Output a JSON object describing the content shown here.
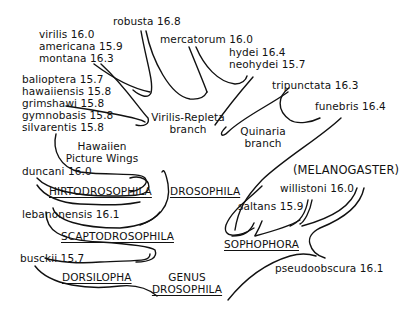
{
  "species": [
    {
      "name": "robusta",
      "value": "16.8"
    },
    {
      "name": "virilis",
      "value": "16.0"
    },
    {
      "name": "americana",
      "value": "15.9"
    },
    {
      "name": "montana",
      "value": "16.3"
    },
    {
      "name": "mercatorum",
      "value": "16.0"
    },
    {
      "name": "hydei",
      "value": "16.4"
    },
    {
      "name": "neohydei",
      "value": "15.7"
    },
    {
      "name": "balioptera",
      "value": "15.7"
    },
    {
      "name": "hawaiiensis",
      "value": "15.8"
    },
    {
      "name": "grimshawi",
      "value": "15.8"
    },
    {
      "name": "gymnobasis",
      "value": "15.8"
    },
    {
      "name": "silvarentis",
      "value": "15.8"
    },
    {
      "name": "tripunctata",
      "value": "16.3"
    },
    {
      "name": "funebris",
      "value": "16.4"
    },
    {
      "name": "duncani",
      "value": "16.0"
    },
    {
      "name": "willistoni",
      "value": "16.0"
    },
    {
      "name": "saltans",
      "value": "15.9"
    },
    {
      "name": "lebanonensis",
      "value": "16.1"
    },
    {
      "name": "busckii",
      "value": "15.7"
    },
    {
      "name": "pseudoobscura",
      "value": "16.1"
    }
  ],
  "labels": {
    "species_lines": {
      "robusta": "robusta 16.8",
      "virilis": "virilis 16.0",
      "americana": "americana 15.9",
      "montana": "montana 16.3",
      "mercatorum": "mercatorum 16.0",
      "hydei": "hydei 16.4",
      "neohydei": "neohydei 15.7",
      "balioptera": "balioptera 15.7",
      "hawaiiensis": "hawaiiensis 15.8",
      "grimshawi": "grimshawi 15.8",
      "gymnobasis": "gymnobasis 15.8",
      "silvarentis": "silvarentis 15.8",
      "tripunctata": "tripunctata 16.3",
      "funebris": "funebris 16.4",
      "duncani": "duncani 16.0",
      "willistoni": "willistoni 16.0",
      "saltans": "saltans 15.9",
      "lebanonensis": "lebanonensis 16.1",
      "busckii": "busckii 15.7",
      "pseudoobscura": "pseudoobscura 16.1"
    },
    "groups": {
      "virilis_repleta_1": "Virilis-Repleta",
      "virilis_repleta_2": "branch",
      "quinaria_1": "Quinaria",
      "quinaria_2": "branch",
      "hawaiien_1": "Hawaiien",
      "hawaiien_2": "Picture Wings",
      "melanogaster": "(MELANOGASTER)"
    },
    "subgenera": {
      "hirtodrosophila": "HIRTODROSOPHILA",
      "drosophila": "DROSOPHILA",
      "scaptodrosophila": "SCAPTODROSOPHILA",
      "sophophora": "SOPHOPHORA",
      "dorsilopha": "DORSILOPHA"
    },
    "genus": {
      "line1": "GENUS",
      "line2": "DROSOPHILA"
    }
  }
}
